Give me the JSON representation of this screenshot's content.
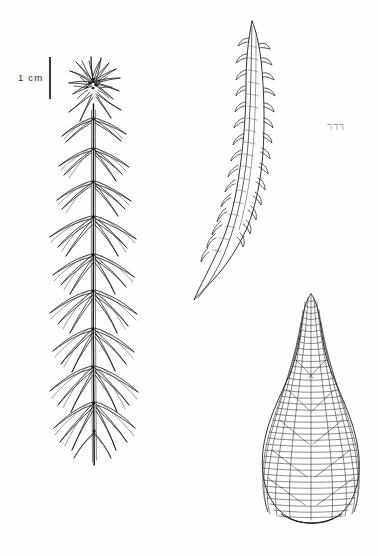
{
  "plate": {
    "title": "Botanical line illustration plate",
    "background_color": "#fefefe",
    "ink_color": "#1c1c1c",
    "width": 378,
    "height": 556
  },
  "scale_bar": {
    "label": "1 cm",
    "orientation": "vertical",
    "bar_length_px": 42,
    "position": "upper-left"
  },
  "annotation": {
    "text": "דדר",
    "color": "#8d8d8d",
    "position": "upper-right"
  },
  "figures": [
    {
      "id": "habit",
      "name": "whole-plant-habit",
      "description": "Whole plant habit: erect stem with apical rosette (comal tuft) of crowded leaves and whorls of spreading, recurved leaves along the stem",
      "position": "left",
      "stem_axis_x": 93,
      "extent": {
        "top": 55,
        "bottom": 466,
        "left": 28,
        "right": 158
      }
    },
    {
      "id": "leaf-lateral",
      "name": "single-leaf-lateral-view",
      "description": "Single narrow lanceolate leaf, falcate-secund, with toothed / papillose margins and an attenuate curved base",
      "position": "top-right",
      "extent": {
        "top": 20,
        "bottom": 305,
        "left": 195,
        "right": 268
      }
    },
    {
      "id": "leaf-areolation",
      "name": "leaf-cell-areolation",
      "description": "Ovate leaf with narrow acuminate apex showing rhomboidal cell areolation across the lamina and a decurrent base",
      "position": "bottom-right",
      "extent": {
        "top": 293,
        "bottom": 524,
        "left": 261,
        "right": 360
      }
    }
  ],
  "icons": {
    "scale_rule": "vertical-rule-icon"
  }
}
